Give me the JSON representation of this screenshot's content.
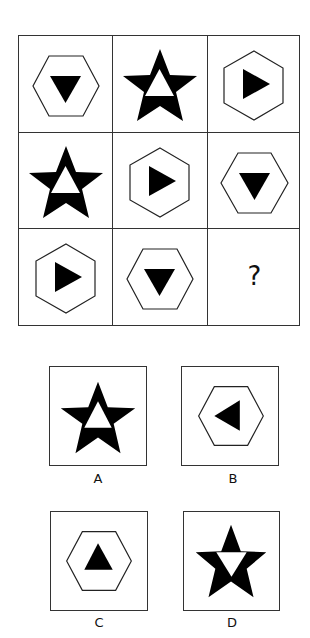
{
  "puzzle": {
    "grid": [
      [
        {
          "shape": "hexagon-flat",
          "inner": "triangle-down",
          "inner_fill": "black"
        },
        {
          "shape": "star",
          "inner": "triangle-up",
          "inner_fill": "white"
        },
        {
          "shape": "hexagon-pointy",
          "inner": "triangle-right",
          "inner_fill": "black"
        }
      ],
      [
        {
          "shape": "star",
          "inner": "triangle-up",
          "inner_fill": "white"
        },
        {
          "shape": "hexagon-pointy",
          "inner": "triangle-right",
          "inner_fill": "black"
        },
        {
          "shape": "hexagon-flat",
          "inner": "triangle-down",
          "inner_fill": "black"
        }
      ],
      [
        {
          "shape": "hexagon-pointy",
          "inner": "triangle-right",
          "inner_fill": "black"
        },
        {
          "shape": "hexagon-flat",
          "inner": "triangle-down",
          "inner_fill": "black"
        },
        {
          "shape": "missing",
          "label": "?"
        }
      ]
    ],
    "missing_label": "?"
  },
  "options": [
    {
      "label": "A",
      "shape": "star",
      "inner": "triangle-up",
      "inner_fill": "white"
    },
    {
      "label": "B",
      "shape": "hexagon-flat",
      "inner": "triangle-left",
      "inner_fill": "black"
    },
    {
      "label": "C",
      "shape": "hexagon-flat",
      "inner": "triangle-up",
      "inner_fill": "black"
    },
    {
      "label": "D",
      "shape": "star",
      "inner": "triangle-down",
      "inner_fill": "white"
    }
  ],
  "colors": {
    "stroke": "#333333",
    "fill": "#000000",
    "background": "#ffffff"
  }
}
